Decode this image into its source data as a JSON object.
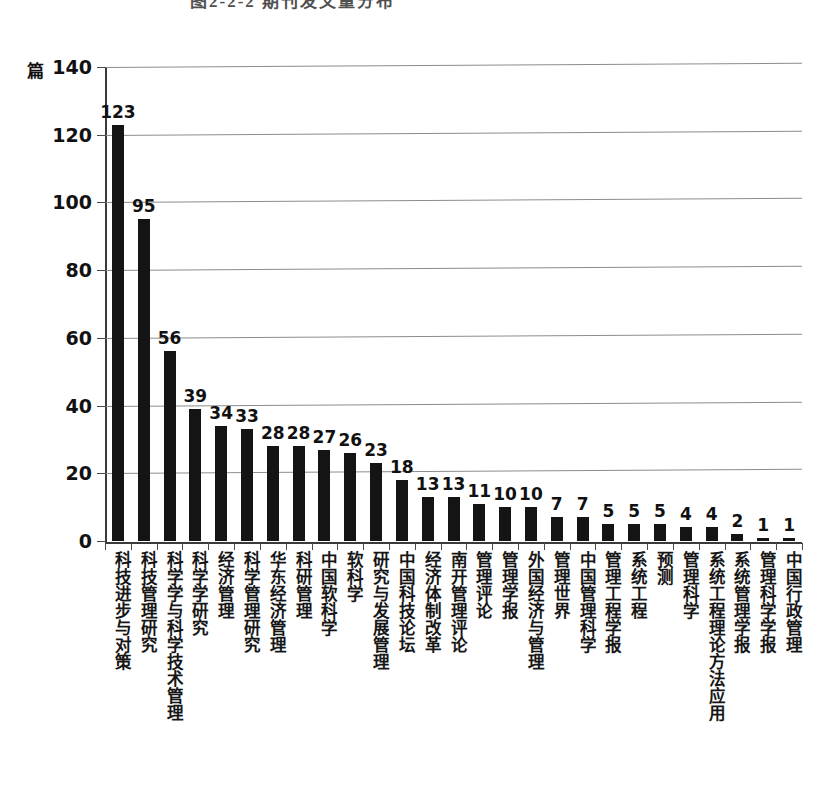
{
  "caption": {
    "text": "图2-2-2 期刊发文量分布"
  },
  "axis": {
    "unit_label": "篇",
    "y_ticks": [
      0,
      20,
      40,
      60,
      80,
      100,
      120,
      140
    ],
    "y_min": 0,
    "y_max": 140
  },
  "chart_data": {
    "type": "bar",
    "title": "",
    "xlabel": "",
    "ylabel": "篇",
    "ylim": [
      0,
      140
    ],
    "yticks": [
      0,
      20,
      40,
      60,
      80,
      100,
      120,
      140
    ],
    "grid": true,
    "legend": "none",
    "orientation": "vertical",
    "bar_color": "#141414",
    "categories": [
      "科技进步与对策",
      "科技管理研究",
      "科学学与科学技术管理",
      "科学学研究",
      "经济管理",
      "科学管理研究",
      "华东经济管理",
      "科研管理",
      "中国软科学",
      "软科学",
      "研究与发展管理",
      "中国科技论坛",
      "经济体制改革",
      "南开管理评论",
      "管理评论",
      "管理学报",
      "外国经济与管理",
      "管理世界",
      "中国管理科学",
      "管理工程学报",
      "系统工程",
      "预测",
      "管理科学",
      "系统工程理论方法应用",
      "系统管理学报",
      "管理科学学报",
      "中国行政管理"
    ],
    "values": [
      123,
      95,
      56,
      39,
      34,
      33,
      28,
      28,
      27,
      26,
      23,
      18,
      13,
      13,
      11,
      10,
      10,
      7,
      7,
      5,
      5,
      5,
      4,
      4,
      2,
      1,
      1
    ]
  }
}
